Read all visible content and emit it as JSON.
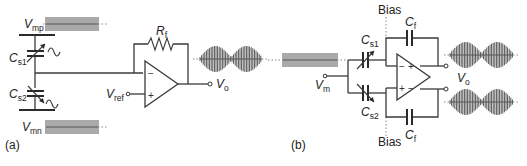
{
  "figure": {
    "panel_a": {
      "label": "(a)",
      "vmp": {
        "main": "V",
        "sub": "mp"
      },
      "vmn": {
        "main": "V",
        "sub": "mn"
      },
      "cs1": {
        "main": "C",
        "sub": "s1"
      },
      "cs2": {
        "main": "C",
        "sub": "s2"
      },
      "rf": {
        "main": "R",
        "sub": "f"
      },
      "vref": {
        "main": "V",
        "sub": "ref"
      },
      "vo": {
        "main": "V",
        "sub": "o"
      },
      "opamp": {
        "minus": "−",
        "plus": "+"
      }
    },
    "panel_b": {
      "label": "(b)",
      "bias_top": "Bias",
      "bias_bottom": "Bias",
      "vm": {
        "main": "V",
        "sub": "m"
      },
      "cs1": {
        "main": "C",
        "sub": "s1"
      },
      "cs2": {
        "main": "C",
        "sub": "s2"
      },
      "cf_top": {
        "main": "C",
        "sub": "f"
      },
      "cf_bottom": {
        "main": "C",
        "sub": "f"
      },
      "vo": {
        "main": "V",
        "sub": "o"
      },
      "opamp": {
        "top_minus": "−",
        "top_plus": "+",
        "bottom_plus": "+",
        "bottom_minus": "−"
      }
    }
  }
}
